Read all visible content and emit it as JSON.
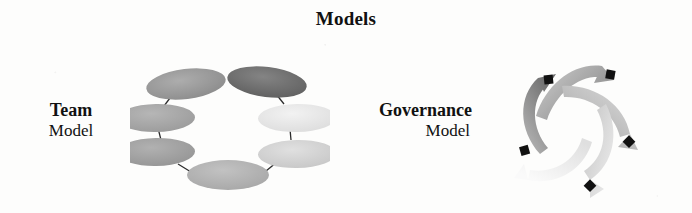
{
  "page": {
    "title": "Models",
    "background_color": "#fdfdfc",
    "text_color": "#111111"
  },
  "sections": [
    {
      "id": "team",
      "label_line1": "Team",
      "label_line2": "Model",
      "diagram": {
        "type": "cycle-ring-ellipses",
        "node_count": 6,
        "node_shades": [
          "#9a9a9a",
          "#6f6f6f",
          "#e6e6e6",
          "#d2d2d2",
          "#b3b3b3",
          "#9e9e9e"
        ],
        "connector_color": "#2b2b2b"
      }
    },
    {
      "id": "governance",
      "label_line1": "Governance",
      "label_line2": "Model",
      "diagram": {
        "type": "cycle-swirl-arrows",
        "arrow_count": 5,
        "arrow_shades": [
          "#7d7d7d",
          "#8d8d8d",
          "#a8a8a8",
          "#c9c9c9",
          "#ececec"
        ],
        "marker_color": "#111111",
        "marker_count": 5
      }
    }
  ]
}
